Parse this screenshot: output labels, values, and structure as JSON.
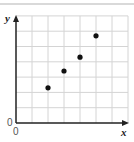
{
  "chart_data": {
    "type": "scatter",
    "title": "",
    "xlabel": "x",
    "ylabel": "y",
    "origin_labels": [
      "0",
      "0"
    ],
    "grid": true,
    "xlim": [
      0,
      7
    ],
    "ylim": [
      0,
      7
    ],
    "series": [
      {
        "name": "points",
        "x": [
          2,
          3,
          4,
          5
        ],
        "y": [
          2.3,
          3.4,
          4.3,
          5.7
        ]
      }
    ],
    "colors": {
      "grid": "#d4d4d4",
      "axis": "#222222",
      "point": "#111111"
    }
  }
}
